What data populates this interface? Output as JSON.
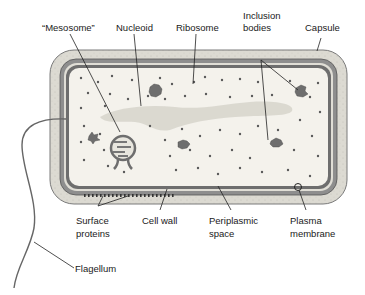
{
  "diagram": {
    "colors": {
      "capsule": "#dcdad2",
      "cell_wall": "#8e8e8e",
      "periplasm": "#e8e6de",
      "membrane": "#6a6a6a",
      "cytoplasm": "#f4f2ec",
      "nucleoid": "#dad8d0",
      "ribosome": "#555555",
      "inclusion": "#707070",
      "line": "#222222"
    },
    "labels": {
      "mesosome": "“Mesosome”",
      "nucleoid": "Nucleoid",
      "ribosome": "Ribosome",
      "inclusion_line1": "Inclusion",
      "inclusion_line2": "bodies",
      "capsule": "Capsule",
      "surface_line1": "Surface",
      "surface_line2": "proteins",
      "cell_wall": "Cell wall",
      "periplasmic_line1": "Periplasmic",
      "periplasmic_line2": "space",
      "plasma_line1": "Plasma",
      "plasma_line2": "membrane",
      "flagellum": "Flagellum"
    }
  }
}
